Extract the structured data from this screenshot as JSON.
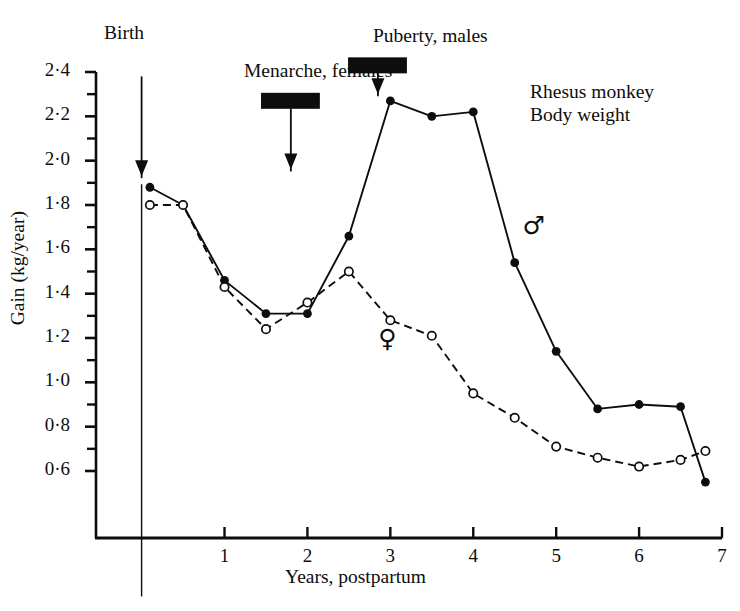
{
  "figure": {
    "caption_note_lines": [
      "Rhesus monkey",
      "Body weight"
    ],
    "note_line_1": "Rhesus monkey",
    "note_line_2": "Body weight",
    "background": "#ffffff",
    "ink": "#0d0d0d"
  },
  "axes": {
    "ylabel": "Gain (kg/year)",
    "xlabel": "Years, postpartum",
    "ylim": [
      0.5,
      2.5
    ],
    "xlim": [
      -0.55,
      7.0
    ],
    "y_ticks_major": [
      "0·6",
      "0·8",
      "1·0",
      "1·2",
      "1·4",
      "1·6",
      "1·8",
      "2·0",
      "2·2",
      "2·4"
    ],
    "y_ticks_major_values": [
      0.6,
      0.8,
      1.0,
      1.2,
      1.4,
      1.6,
      1.8,
      2.0,
      2.2,
      2.4
    ],
    "y_ticks_minor_values": [
      0.7,
      0.9,
      1.1,
      1.3,
      1.5,
      1.7,
      1.9,
      2.1,
      2.3
    ],
    "x_ticks": [
      "1",
      "2",
      "3",
      "4",
      "5",
      "6",
      "7"
    ],
    "x_ticks_values": [
      1,
      2,
      3,
      4,
      5,
      6,
      7
    ],
    "grid": false
  },
  "annotations": {
    "birth": {
      "label": "Birth",
      "x_value": 0.0,
      "line_top_value": 2.38,
      "line_bottom_value": 0.44,
      "arrow_tip_value": 1.93
    },
    "menarche": {
      "label": "Menarche, females",
      "bar_x_start": 1.44,
      "bar_x_end": 2.15,
      "bar_y_value": 2.27,
      "arrow_x_value": 1.8,
      "arrow_tip_value": 1.96
    },
    "puberty": {
      "label": "Puberty, males",
      "bar_x_start": 2.49,
      "bar_x_end": 3.2,
      "bar_y_value": 2.43,
      "arrow_x_value": 2.85,
      "arrow_tip_value": 2.3
    },
    "male_symbol": {
      "glyph": "♂",
      "x_value": 4.74,
      "y_value": 1.69
    },
    "female_symbol": {
      "glyph": "♀",
      "x_value": 3.0,
      "y_value": 1.18
    }
  },
  "chart_data": {
    "type": "line",
    "title": "Rhesus monkey Body weight",
    "xlabel": "Years, postpartum",
    "ylabel": "Gain (kg/year)",
    "xlim": [
      -0.55,
      7.0
    ],
    "ylim": [
      0.5,
      2.5
    ],
    "grid": false,
    "legend_position": "inline-symbols",
    "series": [
      {
        "name": "males",
        "symbol": "♂",
        "marker": "filled-circle",
        "line_style": "solid",
        "color": "#0d0d0d",
        "points": [
          {
            "x": 0.1,
            "y": 1.88
          },
          {
            "x": 0.5,
            "y": 1.8
          },
          {
            "x": 1.0,
            "y": 1.46
          },
          {
            "x": 1.5,
            "y": 1.31
          },
          {
            "x": 2.0,
            "y": 1.31
          },
          {
            "x": 2.5,
            "y": 1.66
          },
          {
            "x": 3.0,
            "y": 2.27
          },
          {
            "x": 3.5,
            "y": 2.2
          },
          {
            "x": 4.0,
            "y": 2.22
          },
          {
            "x": 4.5,
            "y": 1.54
          },
          {
            "x": 5.0,
            "y": 1.14
          },
          {
            "x": 5.5,
            "y": 0.88
          },
          {
            "x": 6.0,
            "y": 0.9
          },
          {
            "x": 6.5,
            "y": 0.89
          },
          {
            "x": 6.8,
            "y": 0.55
          }
        ]
      },
      {
        "name": "females",
        "symbol": "♀",
        "marker": "open-circle",
        "line_style": "dashed",
        "color": "#0d0d0d",
        "points": [
          {
            "x": 0.1,
            "y": 1.8
          },
          {
            "x": 0.5,
            "y": 1.8
          },
          {
            "x": 1.0,
            "y": 1.43
          },
          {
            "x": 1.5,
            "y": 1.24
          },
          {
            "x": 2.0,
            "y": 1.36
          },
          {
            "x": 2.5,
            "y": 1.5
          },
          {
            "x": 3.0,
            "y": 1.28
          },
          {
            "x": 3.5,
            "y": 1.21
          },
          {
            "x": 4.0,
            "y": 0.95
          },
          {
            "x": 4.5,
            "y": 0.84
          },
          {
            "x": 5.0,
            "y": 0.71
          },
          {
            "x": 5.5,
            "y": 0.66
          },
          {
            "x": 6.0,
            "y": 0.62
          },
          {
            "x": 6.5,
            "y": 0.65
          },
          {
            "x": 6.8,
            "y": 0.69
          }
        ]
      }
    ]
  }
}
